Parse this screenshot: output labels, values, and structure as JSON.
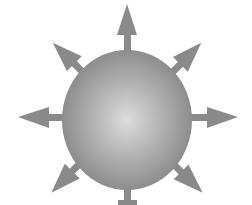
{
  "diagram": {
    "background": "#ffffff",
    "sphere": {
      "center": [
        127,
        120
      ],
      "rx": 65,
      "ry": 70,
      "center_color": "#dcdcdc",
      "edge_color": "#858585"
    },
    "arrow_color": "#8a8a8a",
    "arrows": [
      {
        "direction": "up",
        "angle": -90
      },
      {
        "direction": "up-right",
        "angle": -45
      },
      {
        "direction": "right",
        "angle": 0
      },
      {
        "direction": "down-right",
        "angle": 45
      },
      {
        "direction": "down",
        "angle": 90
      },
      {
        "direction": "down-left",
        "angle": 135
      },
      {
        "direction": "left",
        "angle": 180
      },
      {
        "direction": "up-left",
        "angle": -135
      }
    ]
  }
}
